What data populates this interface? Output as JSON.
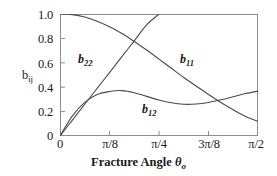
{
  "chart_data": {
    "type": "line",
    "title": "",
    "xlabel": "Fracture Angle θo",
    "ylabel": "bij",
    "xlim": [
      0,
      1.5707963
    ],
    "ylim": [
      0,
      1.0
    ],
    "grid": false,
    "legend_position": "inline-curve-labels",
    "xtick_labels": [
      "0",
      "π/8",
      "π/4",
      "3π/8",
      "π/2"
    ],
    "xtick_values": [
      0,
      0.3926991,
      0.7853982,
      1.1780972,
      1.5707963
    ],
    "ytick_labels": [
      "1.0",
      "0.8",
      "0.6",
      "0.4",
      "0.2",
      "0"
    ],
    "ytick_values": [
      1.0,
      0.8,
      0.6,
      0.4,
      0.2,
      0
    ],
    "x": [
      0,
      0.0982,
      0.1963,
      0.2945,
      0.3927,
      0.4909,
      0.589,
      0.6872,
      0.7854,
      0.8836,
      0.9817,
      1.0799,
      1.1781,
      1.2763,
      1.3744,
      1.4726,
      1.5708
    ],
    "series": [
      {
        "name": "b11",
        "label": "b11",
        "values": [
          1.0,
          0.995,
          0.975,
          0.94,
          0.895,
          0.84,
          0.775,
          0.705,
          0.63,
          0.555,
          0.48,
          0.41,
          0.34,
          0.275,
          0.215,
          0.16,
          0.12
        ]
      },
      {
        "name": "b22",
        "label": "b22",
        "values": [
          0.0,
          0.13,
          0.26,
          0.39,
          0.52,
          0.65,
          0.78,
          0.91,
          1.0,
          null,
          null,
          null,
          null,
          null,
          null,
          null,
          null
        ]
      },
      {
        "name": "b12",
        "label": "b12",
        "values": [
          0.0,
          0.165,
          0.275,
          0.34,
          0.365,
          0.372,
          0.355,
          0.325,
          0.295,
          0.272,
          0.26,
          0.262,
          0.275,
          0.297,
          0.322,
          0.348,
          0.368
        ]
      }
    ],
    "annotations": [
      {
        "text": "b22",
        "x": 0.16,
        "y": 0.63
      },
      {
        "text": "b11",
        "x": 0.95,
        "y": 0.63
      },
      {
        "text": "b12",
        "x": 0.65,
        "y": 0.225
      }
    ],
    "colors": {
      "background": "#ffffff",
      "axis": "#8c8c8c",
      "curve": "#4a4a4a",
      "text": "#1a1a1a"
    }
  },
  "axes": {
    "y_title_base": "b",
    "y_title_sub": "ij",
    "x_title_text": "Fracture Angle ",
    "x_title_symbol": "θ",
    "x_title_sub": "o"
  },
  "curve_labels": {
    "b22": {
      "base": "b",
      "sub": "22"
    },
    "b11": {
      "base": "b",
      "sub": "11"
    },
    "b12": {
      "base": "b",
      "sub": "12"
    }
  }
}
